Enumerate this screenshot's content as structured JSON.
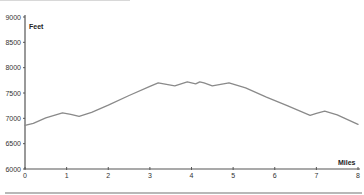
{
  "chart_data": {
    "type": "line",
    "title": "",
    "xlabel": "Miles",
    "ylabel": "Feet",
    "xlim": [
      0,
      8
    ],
    "ylim": [
      6000,
      9000
    ],
    "x_ticks": [
      "0",
      "1",
      "2",
      "3",
      "4",
      "5",
      "6",
      "7",
      "8"
    ],
    "y_ticks": [
      "6000",
      "6500",
      "7000",
      "7500",
      "8000",
      "8500",
      "9000"
    ],
    "grid": false,
    "legend": null,
    "series": [
      {
        "name": "Elevation",
        "color": "#8a8a8a",
        "x": [
          0,
          0.2,
          0.5,
          0.9,
          1.1,
          1.3,
          1.6,
          2.0,
          2.5,
          3.0,
          3.2,
          3.6,
          3.9,
          4.0,
          4.1,
          4.2,
          4.3,
          4.5,
          4.9,
          5.3,
          5.8,
          6.3,
          6.85,
          7.0,
          7.2,
          7.5,
          8.0
        ],
        "y": [
          6860,
          6900,
          7010,
          7110,
          7080,
          7040,
          7120,
          7260,
          7450,
          7630,
          7700,
          7640,
          7720,
          7700,
          7680,
          7720,
          7700,
          7640,
          7700,
          7600,
          7420,
          7250,
          7060,
          7100,
          7140,
          7070,
          6880
        ]
      }
    ]
  },
  "axes": {
    "y_title": "Feet",
    "x_title": "Miles"
  }
}
